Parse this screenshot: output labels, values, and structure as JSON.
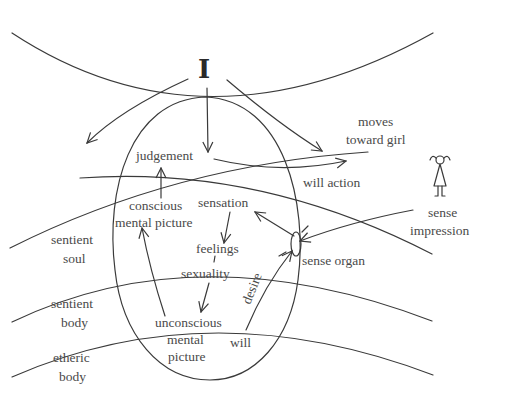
{
  "diagram": {
    "ego_label": "I",
    "labels": {
      "judgement": "judgement",
      "moves_line1": "moves",
      "moves_line2": "toward girl",
      "will_action": "will action",
      "conscious_line1": "conscious",
      "conscious_line2": "mental picture",
      "sensation": "sensation",
      "feelings": "feelings",
      "sexuality": "sexuality",
      "sense_organ": "sense organ",
      "sense_impression_line1": "sense",
      "sense_impression_line2": "impression",
      "desire": "desire",
      "will": "will",
      "unconscious_line1": "unconscious",
      "unconscious_line2": "mental",
      "unconscious_line3": "picture"
    },
    "layers": {
      "sentient_soul_line1": "sentient",
      "sentient_soul_line2": "soul",
      "sentient_body_line1": "sentient",
      "sentient_body_line2": "body",
      "etheric_body_line1": "etheric",
      "etheric_body_line2": "body"
    },
    "icons": {
      "girl": "stick-figure-girl-icon"
    }
  }
}
